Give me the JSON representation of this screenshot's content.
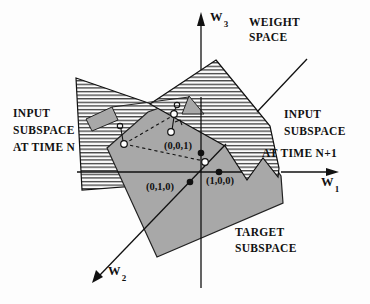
{
  "axes": {
    "w1": {
      "base": "W",
      "sub": "1"
    },
    "w2": {
      "base": "W",
      "sub": "2"
    },
    "w3": {
      "base": "W",
      "sub": "3"
    }
  },
  "regions": {
    "weight_space": {
      "lines": [
        "WEIGHT",
        "SPACE"
      ]
    },
    "input_subspace_n": {
      "lines": [
        "INPUT",
        "SUBSPACE",
        "AT TIME N"
      ]
    },
    "input_subspace_n1": {
      "lines": [
        "INPUT",
        "SUBSPACE",
        "AT TIME N+1"
      ]
    },
    "target_subspace": {
      "lines": [
        "TARGET",
        "SUBSPACE"
      ]
    }
  },
  "points": {
    "p001": {
      "label": "(0,0,1)"
    },
    "p100": {
      "label": "(1,0,0)"
    },
    "p010": {
      "label": "(0,1,0)"
    }
  },
  "colors": {
    "plane_gray": "#a8a8a8",
    "line_black": "#111111",
    "hatch_line": "#1a1a1a"
  }
}
